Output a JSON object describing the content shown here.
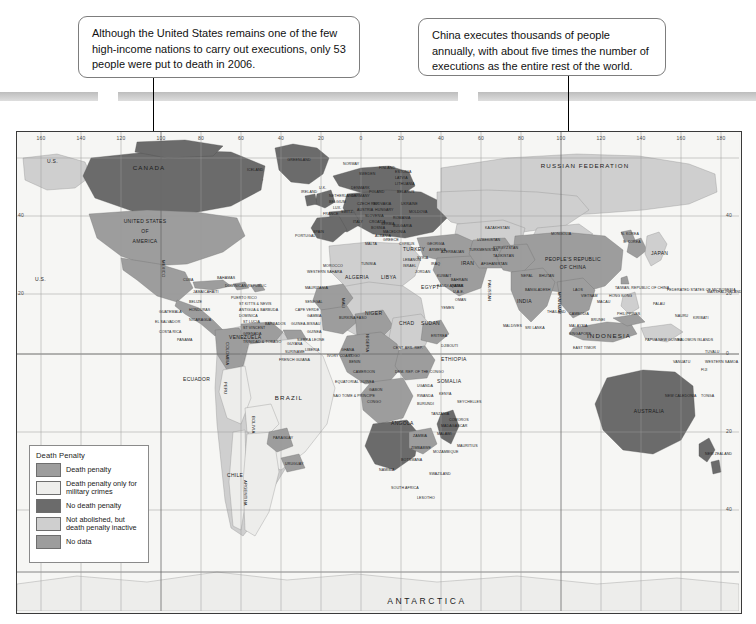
{
  "page": {
    "map_region_name": "world-map-death-penalty"
  },
  "callouts": [
    {
      "id": "us",
      "text": "Although the United States remains one of the few high-income nations to carry out executions, only 53 people were put to death in 2006.",
      "points_to": "UNITED STATES OF AMERICA"
    },
    {
      "id": "china",
      "text": "China executes thousands of people annually, with about five times the number of executions as the entire rest of the world.",
      "points_to": "PEOPLE'S REPUBLIC OF CHINA"
    }
  ],
  "legend": {
    "title": "Death Penalty",
    "items": [
      {
        "label": "Death penalty",
        "color": "#9d9d9d"
      },
      {
        "label": "Death penalty only for military crimes",
        "color": "#eeeeec"
      },
      {
        "label": "No death penalty",
        "color": "#6b6b6b"
      },
      {
        "label": "Not abolished, but death penalty inactive",
        "color": "#cfcfcf"
      },
      {
        "label": "No data",
        "color": "#9d9d9d"
      }
    ]
  },
  "graticule": {
    "longitudes": [
      "160",
      "140",
      "120",
      "100",
      "80",
      "60",
      "40",
      "20",
      "0",
      "20",
      "40",
      "60",
      "80",
      "100",
      "120",
      "140",
      "160",
      "180"
    ],
    "latitudes_left": [
      "40",
      "20"
    ],
    "latitudes_right": [
      "40",
      "20",
      "0",
      "20",
      "40"
    ]
  },
  "map_labels": {
    "continents": [
      {
        "text": "ANTARCTICA",
        "size": "big"
      }
    ],
    "major": [
      "CANADA",
      "UNITED STATES OF AMERICA",
      "BRAZIL",
      "RUSSIAN FEDERATION",
      "INDONESIA",
      "AUSTRALIA",
      "GREENLAND"
    ],
    "north_america": [
      "U.S.",
      "U.S.",
      "MEXICO",
      "CUBA",
      "BAHAMAS",
      "JAMAICA",
      "HAITI",
      "DOMINICAN REPUBLIC",
      "PUERTO RICO",
      "BELIZE",
      "GUATEMALA",
      "HONDURAS",
      "EL SALVADOR",
      "NICARAGUA",
      "COSTA RICA",
      "PANAMA",
      "ST KITTS & NEVIS",
      "ANTIGUA & BARBUDA",
      "DOMINICA",
      "ST LUCIA",
      "ST VINCENT",
      "BARBADOS",
      "GRENADA",
      "TRINIDAD & TOBAGO"
    ],
    "south_america": [
      "COLOMBIA",
      "VENEZUELA",
      "GUYANA",
      "SURINAME",
      "FRENCH GUIANA",
      "ECUADOR",
      "PERU",
      "BOLIVIA",
      "CHILE",
      "ARGENTINA",
      "URUGUAY",
      "PARAGUAY"
    ],
    "africa": [
      "WESTERN SAHARA",
      "MAURITANIA",
      "SENEGAL",
      "CAPE VERDE",
      "GAMBIA",
      "GUINEA-BISSAU",
      "GUINEA",
      "SIERRA LEONE",
      "LIBERIA",
      "IVORY COAST",
      "GHANA",
      "TOGO",
      "BENIN",
      "MALI",
      "BURKINA FASO",
      "NIGER",
      "NIGERIA",
      "CHAD",
      "CAMEROON",
      "EQUATORIAL GUINEA",
      "SAO TOME & PRINCIPE",
      "GABON",
      "CONGO",
      "DEM. REP. OF THE CONGO",
      "CENT. AFR. REP.",
      "ALGERIA",
      "LIBYA",
      "EGYPT",
      "SUDAN",
      "ERITREA",
      "DJIBOUTI",
      "ETHIOPIA",
      "SOMALIA",
      "UGANDA",
      "KENYA",
      "RWANDA",
      "BURUNDI",
      "TANZANIA",
      "ANGOLA",
      "ZAMBIA",
      "MALAWI",
      "MOZAMBIQUE",
      "ZIMBABWE",
      "BOTSWANA",
      "NAMIBIA",
      "SOUTH AFRICA",
      "LESOTHO",
      "SWAZILAND",
      "MADAGASCAR",
      "MAURITIUS",
      "SEYCHELLES",
      "COMOROS",
      "MOROCCO",
      "TUNISIA"
    ],
    "europe": [
      "ICELAND",
      "IRELAND",
      "U.K.",
      "NORWAY",
      "SWEDEN",
      "FINLAND",
      "ESTONIA",
      "LATVIA",
      "LITHUANIA",
      "DENMARK",
      "NETHERLANDS",
      "BELGIUM",
      "LUX.",
      "FRANCE",
      "SPAIN",
      "PORTUGAL",
      "GERMANY",
      "POLAND",
      "BELARUS",
      "UKRAINE",
      "CZECH REP.",
      "SLOVAKIA",
      "AUSTRIA",
      "HUNGARY",
      "SWITZ.",
      "ITALY",
      "SLOVENIA",
      "CROATIA",
      "BOSNIA",
      "SERBIA",
      "ALBANIA",
      "MACEDONIA",
      "ROMANIA",
      "BULGARIA",
      "GREECE",
      "MOLDOVA",
      "MALTA",
      "CYPRUS"
    ],
    "asia": [
      "TURKEY",
      "SYRIA",
      "LEBANON",
      "ISRAEL",
      "JORDAN",
      "IRAQ",
      "IRAN",
      "KUWAIT",
      "SAUDI ARABIA",
      "BAHRAIN",
      "QATAR",
      "U.A.E.",
      "OMAN",
      "YEMEN",
      "GEORGIA",
      "ARMENIA",
      "AZERBAIJAN",
      "KAZAKHSTAN",
      "UZBEKISTAN",
      "TURKMENISTAN",
      "KYRGYZSTAN",
      "TAJIKISTAN",
      "AFGHANISTAN",
      "PAKISTAN",
      "INDIA",
      "NEPAL",
      "BHUTAN",
      "BANGLADESH",
      "SRI LANKA",
      "MALDIVES",
      "MYANMAR",
      "THAILAND",
      "LAOS",
      "VIETNAM",
      "CAMBODIA",
      "MALAYSIA",
      "BRUNEI",
      "SINGAPORE",
      "PHILIPPINES",
      "TAIWAN, REPUBLIC OF CHINA",
      "HONG KONG",
      "MACAU",
      "MONGOLIA",
      "N. KOREA",
      "S. KOREA",
      "JAPAN",
      "PEOPLE'S REPUBLIC OF CHINA",
      "EAST TIMOR"
    ],
    "oceania": [
      "PAPUA NEW GUINEA",
      "SOLOMON ISLANDS",
      "VANUATU",
      "FIJI",
      "NEW CALEDONIA",
      "TONGA",
      "WESTERN SAMOA",
      "TUVALU",
      "KIRIBATI",
      "NAURU",
      "PALAU",
      "MARSHALL ISLANDS",
      "FEDERATED STATES OF MICRONESIA",
      "NEW ZEALAND"
    ]
  }
}
